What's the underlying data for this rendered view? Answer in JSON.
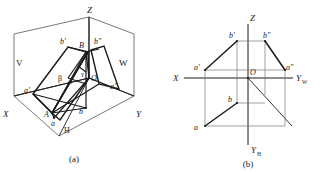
{
  "page": {
    "background": "#ffffff",
    "ink": "#1a1a1a",
    "thin": "#555555"
  },
  "figures": [
    {
      "id": "figure-a",
      "caption": "(a)",
      "description": "Pictorial view of line segment AB in the three-plane projection system",
      "plane_labels": [
        {
          "name": "plane-label-v",
          "text": "V",
          "x": 16,
          "y": 62
        },
        {
          "name": "plane-label-w",
          "text": "W",
          "x": 121,
          "y": 62
        },
        {
          "name": "plane-label-h",
          "text": "H",
          "x": 66,
          "y": 131
        }
      ],
      "axis_labels": [
        {
          "name": "axis-label-z",
          "text": "Z",
          "x": 90,
          "y": 14
        },
        {
          "name": "axis-label-x",
          "text": "X",
          "x": 5,
          "y": 117
        },
        {
          "name": "axis-label-y",
          "text": "Y",
          "x": 139,
          "y": 117
        },
        {
          "name": "origin-label-o",
          "text": "O",
          "x": 92,
          "y": 81
        }
      ],
      "point_labels": [
        {
          "name": "point-label-A",
          "text": "A",
          "x": 45,
          "y": 115
        },
        {
          "name": "point-label-B",
          "text": "B",
          "x": 80,
          "y": 45
        },
        {
          "name": "point-label-a-front",
          "text": "a'",
          "x": 26,
          "y": 92
        },
        {
          "name": "point-label-b-front",
          "text": "b'",
          "x": 62,
          "y": 42
        },
        {
          "name": "point-label-a-side",
          "text": "a″",
          "x": 113,
          "y": 87
        },
        {
          "name": "point-label-b-side",
          "text": "b″",
          "x": 97,
          "y": 42
        },
        {
          "name": "point-label-a-top",
          "text": "a",
          "x": 52,
          "y": 124
        },
        {
          "name": "point-label-b-top",
          "text": "b",
          "x": 80,
          "y": 112
        }
      ],
      "angle_labels": [
        {
          "name": "angle-label-beta",
          "text": "β",
          "x": 60,
          "y": 78
        },
        {
          "name": "angle-label-alpha",
          "text": "α",
          "x": 71,
          "y": 82
        },
        {
          "name": "angle-label-gamma",
          "text": "γ",
          "x": 83,
          "y": 74
        }
      ]
    },
    {
      "id": "figure-b",
      "caption": "(b)",
      "description": "Unfolded orthographic projection drawing of line segment AB",
      "axis_labels": [
        {
          "name": "axis-label-z",
          "text": "Z",
          "x": 251,
          "y": 18
        },
        {
          "name": "axis-label-x",
          "text": "X",
          "x": 176,
          "y": 82
        },
        {
          "name": "axis-label-yw",
          "text": "Y",
          "sub": "W",
          "x": 297,
          "y": 81
        },
        {
          "name": "axis-label-yh",
          "text": "Y",
          "sub": "H",
          "x": 252,
          "y": 151
        },
        {
          "name": "origin-label-o",
          "text": "O",
          "x": 251,
          "y": 73
        }
      ],
      "point_labels": [
        {
          "name": "point-label-a-front",
          "text": "a'",
          "x": 196,
          "y": 68
        },
        {
          "name": "point-label-b-front",
          "text": "b'",
          "x": 230,
          "y": 37
        },
        {
          "name": "point-label-a-side",
          "text": "a″",
          "x": 284,
          "y": 68
        },
        {
          "name": "point-label-b-side",
          "text": "b″",
          "x": 266,
          "y": 37
        },
        {
          "name": "point-label-a-top",
          "text": "a",
          "x": 195,
          "y": 131
        },
        {
          "name": "point-label-b-top",
          "text": "b",
          "x": 227,
          "y": 106
        }
      ]
    }
  ]
}
